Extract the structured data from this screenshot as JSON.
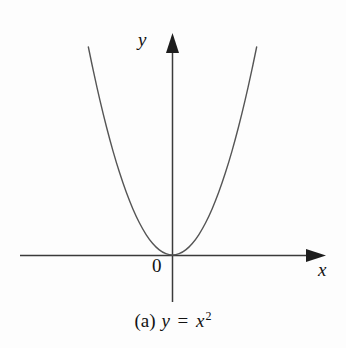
{
  "figure": {
    "caption_index": "(a)",
    "caption_lhs": "y",
    "caption_equals": "=",
    "caption_base": "x",
    "caption_exponent": "2",
    "background_color": "#fdfdfd"
  },
  "labels": {
    "y_axis": "y",
    "x_axis": "x",
    "origin": "0"
  },
  "chart_data": {
    "type": "line",
    "function": "y = x^2",
    "xlabel": "x",
    "ylabel": "y",
    "origin_label": "0",
    "grid": false,
    "legend": null,
    "axis_style": "arrowed-cartesian",
    "axis_color": "#3a3a3a",
    "curve_color": "#555555",
    "curve_width": 1.4,
    "xlim": [
      -2.9,
      2.9
    ],
    "ylim": [
      -1.3,
      8.6
    ],
    "x": [
      -2.55,
      -2.4,
      -2.2,
      -2.0,
      -1.8,
      -1.6,
      -1.4,
      -1.2,
      -1.0,
      -0.8,
      -0.6,
      -0.4,
      -0.2,
      0.0,
      0.2,
      0.4,
      0.6,
      0.8,
      1.0,
      1.2,
      1.4,
      1.6,
      1.8,
      2.0,
      2.2,
      2.4,
      2.55
    ],
    "values": [
      6.5,
      5.76,
      4.84,
      4.0,
      3.24,
      2.56,
      1.96,
      1.44,
      1.0,
      0.64,
      0.36,
      0.16,
      0.04,
      0.0,
      0.04,
      0.16,
      0.36,
      0.64,
      1.0,
      1.44,
      1.96,
      2.56,
      3.24,
      4.0,
      4.84,
      5.76,
      6.5
    ],
    "vertex": [
      0,
      0
    ],
    "annotations": [
      {
        "text": "y",
        "position": "y-axis-tip",
        "style": "italic"
      },
      {
        "text": "x",
        "position": "x-axis-tip",
        "style": "italic"
      },
      {
        "text": "0",
        "position": "origin-lower-left",
        "style": "roman"
      }
    ]
  }
}
